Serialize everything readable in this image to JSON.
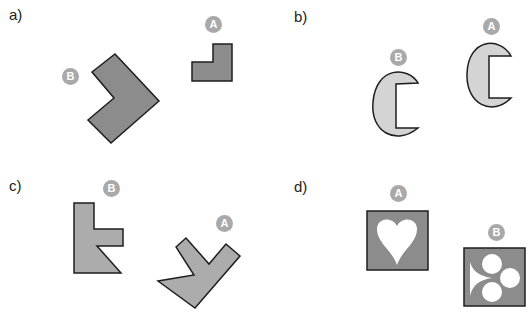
{
  "panels": [
    {
      "label": "a)",
      "shapes": [
        {
          "badge": "A"
        },
        {
          "badge": "B"
        }
      ]
    },
    {
      "label": "b)",
      "shapes": [
        {
          "badge": "B"
        },
        {
          "badge": "A"
        }
      ]
    },
    {
      "label": "c)",
      "shapes": [
        {
          "badge": "B"
        },
        {
          "badge": "A"
        }
      ]
    },
    {
      "label": "d)",
      "shapes": [
        {
          "badge": "A"
        },
        {
          "badge": "B"
        }
      ]
    }
  ],
  "colors": {
    "dark_fill": "#8c8c8c",
    "light_fill": "#d4d4d4",
    "medium_fill": "#acacac",
    "stroke": "#1e1e1e",
    "badge": "#a9a9a9"
  }
}
